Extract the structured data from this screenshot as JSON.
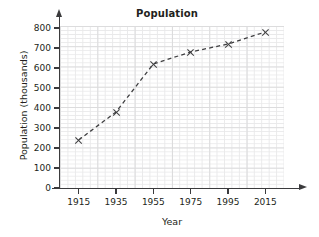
{
  "chart_data": {
    "type": "line",
    "title": "Population",
    "xlabel": "Year",
    "ylabel": "Population (thousands)",
    "x": [
      1915,
      1935,
      1955,
      1975,
      1995,
      2015
    ],
    "values": [
      240,
      380,
      620,
      680,
      720,
      780
    ],
    "xtick_labels": [
      "1915",
      "1935",
      "1955",
      "1975",
      "1995",
      "2015"
    ],
    "ytick_labels": [
      "0",
      "100",
      "200",
      "300",
      "400",
      "500",
      "600",
      "700",
      "800"
    ],
    "ytick_values": [
      0,
      100,
      200,
      300,
      400,
      500,
      600,
      700,
      800
    ],
    "xlim": [
      1905,
      2025
    ],
    "ylim": [
      0,
      810
    ],
    "grid": true,
    "grid_minor": true,
    "legend": false,
    "line_style": "dashed",
    "marker": "x",
    "line_color": "#3f3f41",
    "marker_color": "#3f3f41",
    "grid_color": "#e4e4e5",
    "axis_color": "#3b3b3d",
    "background_color": "#ffffff"
  }
}
